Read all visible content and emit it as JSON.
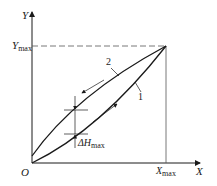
{
  "figure": {
    "axes": {
      "x_label": "X",
      "y_label": "Y",
      "origin_label": "O",
      "x_max_label": "X",
      "x_max_sub": "max",
      "y_max_label": "Y",
      "y_max_sub": "max"
    },
    "curves": [
      {
        "id": "1",
        "label": "1",
        "description": "loading (lower) branch"
      },
      {
        "id": "2",
        "label": "2",
        "description": "unloading (upper) branch"
      }
    ],
    "annotation": {
      "delta_label": "ΔH",
      "delta_sub": "max"
    },
    "colors": {
      "line": "#1a1a1a",
      "dash": "#555555",
      "background": "#ffffff"
    }
  }
}
